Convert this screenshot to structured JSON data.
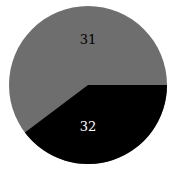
{
  "chart_data": {
    "type": "pie",
    "title": "",
    "labels": [
      "31",
      "32"
    ],
    "values": [
      31,
      32
    ],
    "colors": [
      "#6e6e6e",
      "#000000"
    ],
    "label_colors": [
      "#000000",
      "#ffffff"
    ],
    "legend": null
  },
  "geometry": {
    "cx": 88,
    "cy": 85,
    "r": 79,
    "black_start_deg": 0,
    "black_end_deg": 143
  }
}
